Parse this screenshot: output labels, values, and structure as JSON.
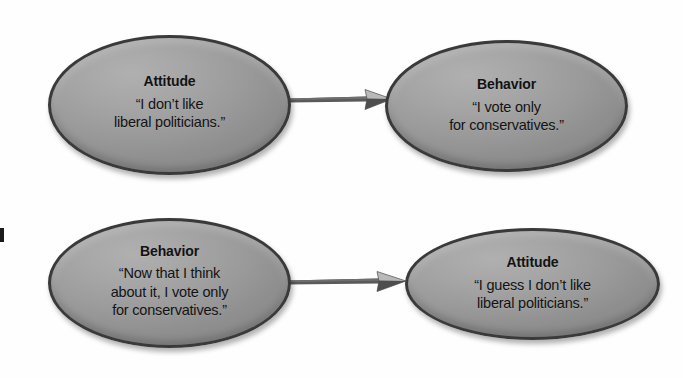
{
  "diagram": {
    "type": "two-row process flow",
    "background_color": "#ffffff",
    "node_fill_color": "#9a9a9a",
    "node_border_color": "#3a3a3a",
    "arrow_color": "#555555",
    "text_color": "#121212"
  },
  "nodes": [
    {
      "id": "top-left",
      "title": "Attitude",
      "quote_lines": [
        "“I don’t like",
        "liberal politicians.”"
      ],
      "row": "top",
      "position": "left"
    },
    {
      "id": "top-right",
      "title": "Behavior",
      "quote_lines": [
        "“I vote only",
        "for conservatives.”"
      ],
      "row": "top",
      "position": "right"
    },
    {
      "id": "bottom-left",
      "title": "Behavior",
      "quote_lines": [
        "“Now that I think",
        "about it, I vote only",
        "for conservatives.”"
      ],
      "row": "bottom",
      "position": "left"
    },
    {
      "id": "bottom-right",
      "title": "Attitude",
      "quote_lines": [
        "“I guess I don’t like",
        "liberal politicians.”"
      ],
      "row": "bottom",
      "position": "right"
    }
  ],
  "arrows": [
    {
      "id": "arrow-top",
      "from": "top-left",
      "to": "top-right",
      "direction": "right"
    },
    {
      "id": "arrow-bottom",
      "from": "bottom-left",
      "to": "bottom-right",
      "direction": "right"
    }
  ]
}
